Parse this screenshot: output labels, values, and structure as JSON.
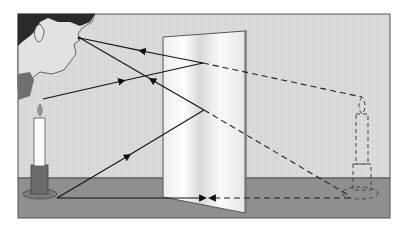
{
  "diagram": {
    "elements": {
      "observer": "person viewing mirror",
      "object": "lit candle on holder",
      "mirror": "plane mirror standing upright on table",
      "virtual_image": "dashed outline of candle behind mirror"
    },
    "rays": [
      {
        "from": "candle-flame",
        "to": "mirror-point-upper",
        "style": "solid",
        "arrow": "toward-mirror"
      },
      {
        "from": "mirror-point-upper",
        "to": "eye",
        "style": "solid",
        "arrow": "toward-eye"
      },
      {
        "from": "candle-base",
        "to": "mirror-point-lower",
        "style": "solid",
        "arrow": "toward-mirror"
      },
      {
        "from": "mirror-point-lower",
        "to": "eye",
        "style": "solid",
        "arrow": "toward-eye"
      },
      {
        "from": "candle-base",
        "to": "mirror-base",
        "style": "solid",
        "arrow": "toward-mirror"
      },
      {
        "from": "mirror-point-upper",
        "to": "virtual-flame",
        "style": "dashed"
      },
      {
        "from": "mirror-point-lower",
        "to": "virtual-base",
        "style": "dashed"
      },
      {
        "from": "virtual-base",
        "to": "mirror-base",
        "style": "dashed",
        "arrow": "toward-mirror"
      }
    ],
    "colors": {
      "wall": "#d8d8d8",
      "table": "#8f8f8f",
      "mirror": "#f4f4f4",
      "hair": "#2a2a2a",
      "ray": "#111111",
      "frame": "#555555"
    }
  }
}
